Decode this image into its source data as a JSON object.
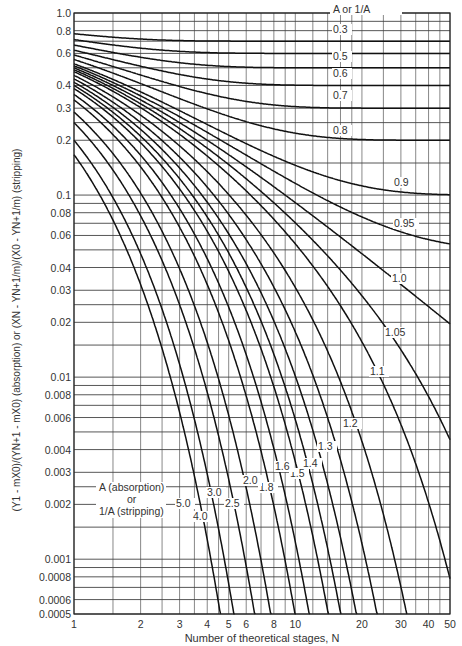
{
  "chart_data": {
    "type": "line",
    "title": "",
    "xlabel": "Number of theoretical stages, N",
    "ylabel": "(Y1 - mX0)/(YN+1 - mX0) (absorption) or (XN - YN+1/m)/(X0 - YN+1/m) (stripping)",
    "xscale": "log",
    "yscale": "log",
    "xlim": [
      1,
      50
    ],
    "ylim": [
      0.0005,
      1.0
    ],
    "grid": true,
    "legend_title": "A or 1/A",
    "bottom_legend": {
      "line1": "A (absorption)",
      "line2": "or",
      "line3": "1/A (stripping)"
    },
    "x_ticks": [
      {
        "value": 1,
        "label": "1"
      },
      {
        "value": 2,
        "label": "2"
      },
      {
        "value": 3,
        "label": "3"
      },
      {
        "value": 4,
        "label": "4"
      },
      {
        "value": 5,
        "label": "5"
      },
      {
        "value": 6,
        "label": "6"
      },
      {
        "value": 8,
        "label": "8"
      },
      {
        "value": 10,
        "label": "10"
      },
      {
        "value": 20,
        "label": "20"
      },
      {
        "value": 30,
        "label": "30"
      },
      {
        "value": 40,
        "label": "40"
      },
      {
        "value": 50,
        "label": "50"
      }
    ],
    "y_ticks": [
      {
        "value": 1.0,
        "label": "1.0"
      },
      {
        "value": 0.8,
        "label": "0.8"
      },
      {
        "value": 0.6,
        "label": "0.6"
      },
      {
        "value": 0.4,
        "label": "0.4"
      },
      {
        "value": 0.3,
        "label": "0.3"
      },
      {
        "value": 0.2,
        "label": "0.2"
      },
      {
        "value": 0.1,
        "label": "0.1"
      },
      {
        "value": 0.08,
        "label": "0.08"
      },
      {
        "value": 0.06,
        "label": "0.06"
      },
      {
        "value": 0.04,
        "label": "0.04"
      },
      {
        "value": 0.03,
        "label": "0.03"
      },
      {
        "value": 0.02,
        "label": "0.02"
      },
      {
        "value": 0.01,
        "label": "0.01"
      },
      {
        "value": 0.008,
        "label": "0.008"
      },
      {
        "value": 0.006,
        "label": "0.006"
      },
      {
        "value": 0.004,
        "label": "0.004"
      },
      {
        "value": 0.003,
        "label": "0.003"
      },
      {
        "value": 0.002,
        "label": "0.002"
      },
      {
        "value": 0.001,
        "label": "0.001"
      },
      {
        "value": 0.0008,
        "label": "0.0008"
      },
      {
        "value": 0.0006,
        "label": "0.0006"
      },
      {
        "value": 0.0005,
        "label": "0.0005"
      }
    ],
    "x_grid": [
      1,
      1.5,
      2,
      2.5,
      3,
      3.5,
      4,
      4.5,
      5,
      6,
      7,
      8,
      9,
      10,
      12,
      14,
      16,
      18,
      20,
      25,
      30,
      35,
      40,
      45,
      50
    ],
    "y_grid": [
      1.0,
      0.9,
      0.8,
      0.7,
      0.6,
      0.5,
      0.4,
      0.3,
      0.25,
      0.2,
      0.15,
      0.1,
      0.09,
      0.08,
      0.07,
      0.06,
      0.05,
      0.04,
      0.03,
      0.025,
      0.02,
      0.015,
      0.01,
      0.009,
      0.008,
      0.007,
      0.006,
      0.005,
      0.004,
      0.003,
      0.0025,
      0.002,
      0.0015,
      0.001,
      0.0009,
      0.0008,
      0.0007,
      0.0006,
      0.0005
    ],
    "series": [
      {
        "name": "0.3",
        "A": 0.3,
        "label_pos": [
          333,
          33
        ]
      },
      {
        "name": "0.4",
        "A": 0.4,
        "label_pos": null
      },
      {
        "name": "0.5",
        "A": 0.5,
        "label_pos": [
          333,
          60
        ]
      },
      {
        "name": "0.6",
        "A": 0.6,
        "label_pos": [
          333,
          77
        ]
      },
      {
        "name": "0.7",
        "A": 0.7,
        "label_pos": [
          333,
          99
        ]
      },
      {
        "name": "0.8",
        "A": 0.8,
        "label_pos": [
          333,
          134
        ]
      },
      {
        "name": "0.9",
        "A": 0.9,
        "label_pos": [
          394,
          186
        ]
      },
      {
        "name": "0.95",
        "A": 0.95,
        "label_pos": [
          394,
          227
        ]
      },
      {
        "name": "1.0",
        "A": 1.0,
        "label_pos": [
          392,
          282
        ]
      },
      {
        "name": "1.05",
        "A": 1.05,
        "label_pos": [
          385,
          336
        ]
      },
      {
        "name": "1.1",
        "A": 1.1,
        "label_pos": [
          370,
          375
        ]
      },
      {
        "name": "1.2",
        "A": 1.2,
        "label_pos": [
          343,
          427
        ]
      },
      {
        "name": "1.3",
        "A": 1.3,
        "label_pos": [
          318,
          450
        ]
      },
      {
        "name": "1.4",
        "A": 1.4,
        "label_pos": [
          303,
          467
        ]
      },
      {
        "name": "1.5",
        "A": 1.5,
        "label_pos": [
          290,
          477
        ]
      },
      {
        "name": "1.6",
        "A": 1.6,
        "label_pos": [
          275,
          470
        ]
      },
      {
        "name": "1.8",
        "A": 1.8,
        "label_pos": [
          259,
          491
        ]
      },
      {
        "name": "2.0",
        "A": 2.0,
        "label_pos": [
          243,
          484
        ]
      },
      {
        "name": "2.5",
        "A": 2.5,
        "label_pos": [
          225,
          507
        ]
      },
      {
        "name": "3.0",
        "A": 3.0,
        "label_pos": [
          207,
          496
        ]
      },
      {
        "name": "4.0",
        "A": 4.0,
        "label_pos": [
          193,
          520
        ]
      },
      {
        "name": "5.0",
        "A": 5.0,
        "label_pos": [
          176,
          507
        ]
      }
    ],
    "formula": "y = (A - 1)/(A^(N+1) - 1); A = 1: y = 1/(N+1)"
  }
}
